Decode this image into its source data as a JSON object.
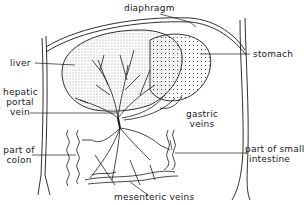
{
  "diagram": {
    "type": "anatomical line drawing",
    "labels": {
      "diaphragm": "diaphragm",
      "stomach": "stomach",
      "liver": "liver",
      "hepatic_portal_vein_1": "hepatic",
      "hepatic_portal_vein_2": "portal",
      "hepatic_portal_vein_3": "vein",
      "gastric_veins_1": "gastric",
      "gastric_veins_2": "veins",
      "part_of_colon_1": "part of",
      "part_of_colon_2": "colon",
      "part_of_small_intestine_1": "part of small",
      "part_of_small_intestine_2": "intestine",
      "mesenteric_veins": "mesenteric veins"
    },
    "colors": {
      "ink": "#1a1a1a",
      "background": "#ffffff"
    }
  }
}
